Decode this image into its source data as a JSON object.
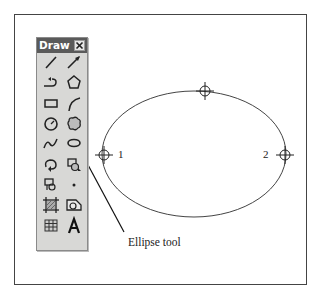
{
  "toolbar": {
    "title": "Draw",
    "close_icon": "close-x-icon",
    "tools": [
      {
        "name": "line-tool",
        "icon": "line-icon"
      },
      {
        "name": "arrow-tool",
        "icon": "arrow-icon"
      },
      {
        "name": "connector-tool",
        "icon": "connector-icon"
      },
      {
        "name": "polygon-tool",
        "icon": "pentagon-icon"
      },
      {
        "name": "rectangle-tool",
        "icon": "rectangle-icon"
      },
      {
        "name": "arc-tool",
        "icon": "arc-icon"
      },
      {
        "name": "circle-tool",
        "icon": "circle-icon"
      },
      {
        "name": "cloud-tool",
        "icon": "cloud-icon"
      },
      {
        "name": "spline-tool",
        "icon": "spline-icon"
      },
      {
        "name": "ellipse-tool",
        "icon": "ellipse-icon"
      },
      {
        "name": "revision-cloud-tool",
        "icon": "revcloud-icon"
      },
      {
        "name": "insert-block-tool",
        "icon": "insert-block-icon"
      },
      {
        "name": "make-block-tool",
        "icon": "make-block-icon"
      },
      {
        "name": "point-tool",
        "icon": "point-icon"
      },
      {
        "name": "hatch-tool",
        "icon": "hatch-icon"
      },
      {
        "name": "region-tool",
        "icon": "region-icon"
      },
      {
        "name": "table-tool",
        "icon": "table-icon"
      },
      {
        "name": "text-tool",
        "icon": "text-A-icon"
      }
    ]
  },
  "drawing": {
    "point_labels": [
      "1",
      "2"
    ],
    "callout": "Ellipse tool"
  },
  "colors": {
    "titlebar": "#5a5a5a",
    "toolbar_bg": "#d8d8d6",
    "line": "#333333"
  }
}
